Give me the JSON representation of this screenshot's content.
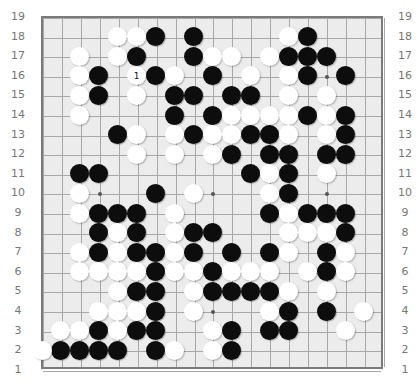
{
  "board": {
    "size": 19,
    "row_labels": [
      "19",
      "18",
      "17",
      "16",
      "15",
      "14",
      "13",
      "12",
      "11",
      "10",
      "9",
      "8",
      "7",
      "6",
      "5",
      "4",
      "3",
      "2",
      "1"
    ],
    "star_points": [
      [
        4,
        4
      ],
      [
        4,
        10
      ],
      [
        4,
        16
      ],
      [
        10,
        4
      ],
      [
        10,
        10
      ],
      [
        10,
        16
      ],
      [
        16,
        4
      ],
      [
        16,
        10
      ],
      [
        16,
        16
      ]
    ],
    "colors": {
      "board": "#ececec",
      "line": "#a8a8a8",
      "border": "#7a7a7a",
      "black": "#0d0d0d",
      "white": "#ffffff",
      "label": "#777777"
    },
    "move_marker": {
      "col": 6,
      "row": 16,
      "text": "1"
    },
    "stones": {
      "black": [
        [
          7,
          18
        ],
        [
          9,
          18
        ],
        [
          15,
          18
        ],
        [
          6,
          17
        ],
        [
          9,
          17
        ],
        [
          14,
          17
        ],
        [
          15,
          17
        ],
        [
          16,
          17
        ],
        [
          4,
          16
        ],
        [
          7,
          16
        ],
        [
          10,
          16
        ],
        [
          15,
          16
        ],
        [
          17,
          16
        ],
        [
          4,
          15
        ],
        [
          8,
          15
        ],
        [
          9,
          15
        ],
        [
          11,
          15
        ],
        [
          12,
          15
        ],
        [
          8,
          14
        ],
        [
          10,
          14
        ],
        [
          15,
          14
        ],
        [
          17,
          14
        ],
        [
          5,
          13
        ],
        [
          9,
          13
        ],
        [
          12,
          13
        ],
        [
          13,
          13
        ],
        [
          17,
          13
        ],
        [
          11,
          12
        ],
        [
          13,
          12
        ],
        [
          14,
          12
        ],
        [
          16,
          12
        ],
        [
          17,
          12
        ],
        [
          3,
          11
        ],
        [
          4,
          11
        ],
        [
          12,
          11
        ],
        [
          14,
          11
        ],
        [
          7,
          10
        ],
        [
          14,
          10
        ],
        [
          4,
          9
        ],
        [
          5,
          9
        ],
        [
          6,
          9
        ],
        [
          13,
          9
        ],
        [
          15,
          9
        ],
        [
          16,
          9
        ],
        [
          17,
          9
        ],
        [
          4,
          8
        ],
        [
          6,
          8
        ],
        [
          9,
          8
        ],
        [
          10,
          8
        ],
        [
          17,
          8
        ],
        [
          4,
          7
        ],
        [
          6,
          7
        ],
        [
          7,
          7
        ],
        [
          9,
          7
        ],
        [
          11,
          7
        ],
        [
          13,
          7
        ],
        [
          16,
          7
        ],
        [
          7,
          6
        ],
        [
          10,
          6
        ],
        [
          16,
          6
        ],
        [
          6,
          5
        ],
        [
          7,
          5
        ],
        [
          10,
          5
        ],
        [
          11,
          5
        ],
        [
          12,
          5
        ],
        [
          13,
          5
        ],
        [
          7,
          4
        ],
        [
          14,
          4
        ],
        [
          16,
          4
        ],
        [
          4,
          3
        ],
        [
          6,
          3
        ],
        [
          7,
          3
        ],
        [
          11,
          3
        ],
        [
          13,
          3
        ],
        [
          14,
          3
        ],
        [
          2,
          2
        ],
        [
          3,
          2
        ],
        [
          4,
          2
        ],
        [
          5,
          2
        ],
        [
          7,
          2
        ],
        [
          11,
          2
        ]
      ],
      "white": [
        [
          5,
          18
        ],
        [
          6,
          18
        ],
        [
          14,
          18
        ],
        [
          3,
          17
        ],
        [
          5,
          17
        ],
        [
          10,
          17
        ],
        [
          11,
          17
        ],
        [
          13,
          17
        ],
        [
          3,
          16
        ],
        [
          6,
          16
        ],
        [
          8,
          16
        ],
        [
          12,
          16
        ],
        [
          14,
          16
        ],
        [
          3,
          15
        ],
        [
          6,
          15
        ],
        [
          14,
          15
        ],
        [
          16,
          15
        ],
        [
          3,
          14
        ],
        [
          11,
          14
        ],
        [
          12,
          14
        ],
        [
          13,
          14
        ],
        [
          14,
          14
        ],
        [
          16,
          14
        ],
        [
          6,
          13
        ],
        [
          8,
          13
        ],
        [
          10,
          13
        ],
        [
          11,
          13
        ],
        [
          14,
          13
        ],
        [
          16,
          13
        ],
        [
          6,
          12
        ],
        [
          8,
          12
        ],
        [
          10,
          12
        ],
        [
          13,
          11
        ],
        [
          16,
          11
        ],
        [
          3,
          10
        ],
        [
          9,
          10
        ],
        [
          13,
          10
        ],
        [
          3,
          9
        ],
        [
          8,
          9
        ],
        [
          14,
          9
        ],
        [
          5,
          8
        ],
        [
          8,
          8
        ],
        [
          14,
          8
        ],
        [
          15,
          8
        ],
        [
          16,
          8
        ],
        [
          3,
          7
        ],
        [
          5,
          7
        ],
        [
          8,
          7
        ],
        [
          14,
          7
        ],
        [
          17,
          7
        ],
        [
          3,
          6
        ],
        [
          4,
          6
        ],
        [
          5,
          6
        ],
        [
          6,
          6
        ],
        [
          8,
          6
        ],
        [
          9,
          6
        ],
        [
          11,
          6
        ],
        [
          12,
          6
        ],
        [
          13,
          6
        ],
        [
          15,
          6
        ],
        [
          17,
          6
        ],
        [
          5,
          5
        ],
        [
          9,
          5
        ],
        [
          14,
          5
        ],
        [
          16,
          5
        ],
        [
          4,
          4
        ],
        [
          5,
          4
        ],
        [
          6,
          4
        ],
        [
          9,
          4
        ],
        [
          13,
          4
        ],
        [
          18,
          4
        ],
        [
          2,
          3
        ],
        [
          3,
          3
        ],
        [
          5,
          3
        ],
        [
          10,
          3
        ],
        [
          17,
          3
        ],
        [
          1,
          2
        ],
        [
          8,
          2
        ],
        [
          10,
          2
        ]
      ]
    }
  }
}
